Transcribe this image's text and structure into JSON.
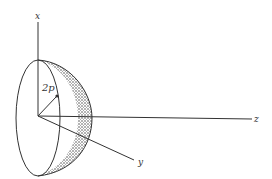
{
  "figure": {
    "axes": {
      "x_label": "x",
      "y_label": "y",
      "z_label": "z"
    },
    "radius_label": "2p",
    "colors": {
      "line": "#333333",
      "shading": "#555555",
      "background": "#ffffff"
    }
  }
}
